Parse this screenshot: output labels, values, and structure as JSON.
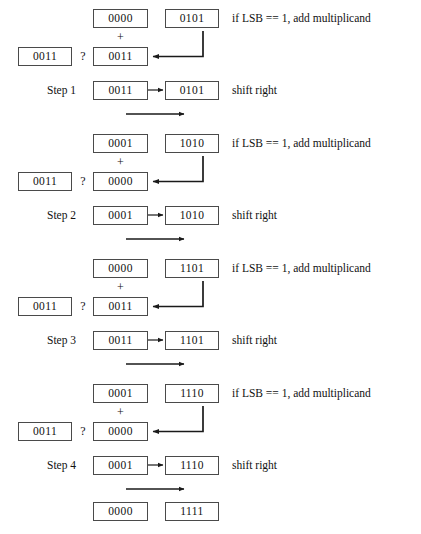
{
  "figure": {
    "multiplicand_label": "0011",
    "question_mark": "?",
    "plus_sign": "+",
    "note_add": "if LSB == 1, add multiplicand",
    "note_shift": "shift right",
    "colors": {
      "box_border": "#4a4a4a",
      "text": "#111111",
      "arrow": "#1a1a1a",
      "background": "#ffffff"
    }
  },
  "blocks": [
    {
      "id": "block-1",
      "add": {
        "product_before": "0000",
        "multiplier": "0101",
        "multiplicand": "0011",
        "sum": "0011",
        "note": "if LSB == 1, add multiplicand"
      },
      "step": {
        "label": "Step 1",
        "product": "0011",
        "multiplier": "0101",
        "note": "shift right"
      }
    },
    {
      "id": "block-2",
      "add": {
        "product_before": "0001",
        "multiplier": "1010",
        "multiplicand": "0011",
        "sum": "0000",
        "note": "if LSB == 1, add multiplicand"
      },
      "step": {
        "label": "Step 2",
        "product": "0001",
        "multiplier": "1010",
        "note": "shift right"
      }
    },
    {
      "id": "block-3",
      "add": {
        "product_before": "0000",
        "multiplier": "1101",
        "multiplicand": "0011",
        "sum": "0011",
        "note": "if LSB == 1, add multiplicand"
      },
      "step": {
        "label": "Step 3",
        "product": "0011",
        "multiplier": "1101",
        "note": "shift right"
      }
    },
    {
      "id": "block-4",
      "add": {
        "product_before": "0001",
        "multiplier": "1110",
        "multiplicand": "0011",
        "sum": "0000",
        "note": "if LSB == 1, add multiplicand"
      },
      "step": {
        "label": "Step 4",
        "product": "0001",
        "multiplier": "1110",
        "note": "shift right"
      }
    }
  ],
  "final": {
    "product": "0000",
    "multiplier": "1111"
  }
}
